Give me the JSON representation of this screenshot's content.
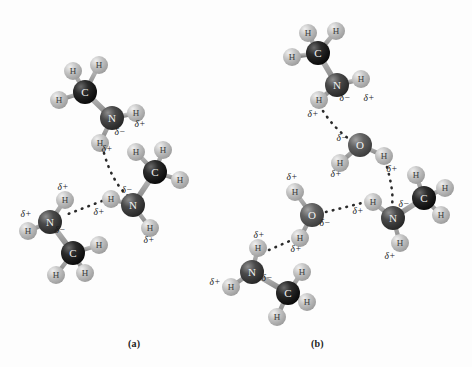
{
  "figure": {
    "background": "#fdfdfd",
    "width": 472,
    "height": 367,
    "panels": [
      {
        "key": "a",
        "label": "(a)",
        "x": 128,
        "y": 338
      },
      {
        "key": "b",
        "label": "(b)",
        "x": 311,
        "y": 338
      }
    ],
    "bottom_cut_text": ""
  },
  "style": {
    "carbon_color": "#141414",
    "carbon_highlight": "#6a6a6a",
    "nitrogen_color": "#3a3a3a",
    "nitrogen_highlight": "#8e8e8e",
    "oxygen_color": "#565656",
    "oxygen_highlight": "#a2a2a2",
    "hydrogen_color": "#b4b4b4",
    "hydrogen_highlight": "#ececec",
    "bond_color": "#9a9a9a",
    "hbond_color": "#2a2a2a",
    "atom_text_color": "#f2f2f2",
    "charge_text_color": "#1d1d1d"
  },
  "legend": {
    "carbon_symbol": "C",
    "nitrogen_symbol": "N",
    "oxygen_symbol": "O",
    "hydrogen_symbol": "H",
    "delta_negative": "δ−",
    "delta_positive": "δ+"
  },
  "panel_a": {
    "molecules": [
      {
        "name": "methylamine-top-left",
        "atoms": [
          {
            "id": "a1C",
            "element": "C",
            "label": "C",
            "x": 85,
            "y": 92,
            "r": 12
          },
          {
            "id": "a1H1",
            "element": "H",
            "label": "H",
            "x": 73,
            "y": 71,
            "r": 9
          },
          {
            "id": "a1H2",
            "element": "H",
            "label": "H",
            "x": 99,
            "y": 65,
            "r": 9
          },
          {
            "id": "a1H3",
            "element": "H",
            "label": "H",
            "x": 59,
            "y": 100,
            "r": 9
          },
          {
            "id": "a1N",
            "element": "N",
            "label": "N",
            "x": 112,
            "y": 118,
            "r": 12
          },
          {
            "id": "a1H4",
            "element": "H",
            "label": "H",
            "x": 136,
            "y": 113,
            "r": 9
          },
          {
            "id": "a1H5",
            "element": "H",
            "label": "H",
            "x": 100,
            "y": 143,
            "r": 9
          }
        ],
        "bonds": [
          [
            "a1C",
            "a1H1"
          ],
          [
            "a1C",
            "a1H2"
          ],
          [
            "a1C",
            "a1H3"
          ],
          [
            "a1C",
            "a1N"
          ],
          [
            "a1N",
            "a1H4"
          ],
          [
            "a1N",
            "a1H5"
          ]
        ]
      },
      {
        "name": "methylamine-right",
        "atoms": [
          {
            "id": "a2C",
            "element": "C",
            "label": "C",
            "x": 155,
            "y": 172,
            "r": 12
          },
          {
            "id": "a2H1",
            "element": "H",
            "label": "H",
            "x": 136,
            "y": 152,
            "r": 9
          },
          {
            "id": "a2H2",
            "element": "H",
            "label": "H",
            "x": 163,
            "y": 150,
            "r": 9
          },
          {
            "id": "a2H3",
            "element": "H",
            "label": "H",
            "x": 180,
            "y": 180,
            "r": 9
          },
          {
            "id": "a2N",
            "element": "N",
            "label": "N",
            "x": 133,
            "y": 205,
            "r": 12
          },
          {
            "id": "a2H4",
            "element": "H",
            "label": "H",
            "x": 111,
            "y": 199,
            "r": 9
          },
          {
            "id": "a2H5",
            "element": "H",
            "label": "H",
            "x": 150,
            "y": 228,
            "r": 9
          }
        ],
        "bonds": [
          [
            "a2C",
            "a2H1"
          ],
          [
            "a2C",
            "a2H2"
          ],
          [
            "a2C",
            "a2H3"
          ],
          [
            "a2C",
            "a2N"
          ],
          [
            "a2N",
            "a2H4"
          ],
          [
            "a2N",
            "a2H5"
          ]
        ]
      },
      {
        "name": "methylamine-bottom-left",
        "atoms": [
          {
            "id": "a3N",
            "element": "N",
            "label": "N",
            "x": 50,
            "y": 222,
            "r": 12
          },
          {
            "id": "a3H1",
            "element": "H",
            "label": "H",
            "x": 65,
            "y": 200,
            "r": 9
          },
          {
            "id": "a3H2",
            "element": "H",
            "label": "H",
            "x": 28,
            "y": 231,
            "r": 9
          },
          {
            "id": "a3C",
            "element": "C",
            "label": "C",
            "x": 73,
            "y": 253,
            "r": 12
          },
          {
            "id": "a3H3",
            "element": "H",
            "label": "H",
            "x": 99,
            "y": 245,
            "r": 9
          },
          {
            "id": "a3H4",
            "element": "H",
            "label": "H",
            "x": 85,
            "y": 273,
            "r": 9
          },
          {
            "id": "a3H5",
            "element": "H",
            "label": "H",
            "x": 56,
            "y": 275,
            "r": 9
          }
        ],
        "bonds": [
          [
            "a3N",
            "a3H1"
          ],
          [
            "a3N",
            "a3H2"
          ],
          [
            "a3N",
            "a3C"
          ],
          [
            "a3C",
            "a3H3"
          ],
          [
            "a3C",
            "a3H4"
          ],
          [
            "a3C",
            "a3H5"
          ]
        ]
      }
    ],
    "hbonds": [
      {
        "name": "hbond-topN-H-to-rightN",
        "from": "a1H5",
        "to": "a2N",
        "path": "M 104 153 Q 112 182 128 196"
      },
      {
        "name": "hbond-rightN-H-to-leftN",
        "from": "a2H4",
        "to": "a3N",
        "path": "M 102 201 L 63 216"
      }
    ],
    "charges": [
      {
        "text": "δ−",
        "x": 120,
        "y": 135,
        "for": "a1N"
      },
      {
        "text": "δ+",
        "x": 140,
        "y": 127,
        "for": "a1H4"
      },
      {
        "text": "δ+",
        "x": 107,
        "y": 152,
        "for": "a1H5"
      },
      {
        "text": "δ−",
        "x": 127,
        "y": 193,
        "for": "a2N"
      },
      {
        "text": "δ+",
        "x": 99,
        "y": 215,
        "for": "a2H4"
      },
      {
        "text": "δ+",
        "x": 149,
        "y": 243,
        "for": "a2H5"
      },
      {
        "text": "δ+",
        "x": 63,
        "y": 190,
        "for": "a3H1"
      },
      {
        "text": "δ+",
        "x": 26,
        "y": 217,
        "for": "a3H2"
      },
      {
        "text": "δ−",
        "x": 60,
        "y": 233,
        "for": "a3N"
      }
    ]
  },
  "panel_b": {
    "molecules": [
      {
        "name": "methylamine-top",
        "atoms": [
          {
            "id": "b1C",
            "element": "C",
            "label": "C",
            "x": 318,
            "y": 53,
            "r": 12
          },
          {
            "id": "b1H1",
            "element": "H",
            "label": "H",
            "x": 308,
            "y": 33,
            "r": 9
          },
          {
            "id": "b1H2",
            "element": "H",
            "label": "H",
            "x": 336,
            "y": 31,
            "r": 9
          },
          {
            "id": "b1H3",
            "element": "H",
            "label": "H",
            "x": 292,
            "y": 57,
            "r": 9
          },
          {
            "id": "b1N",
            "element": "N",
            "label": "N",
            "x": 337,
            "y": 85,
            "r": 12
          },
          {
            "id": "b1H4",
            "element": "H",
            "label": "H",
            "x": 361,
            "y": 79,
            "r": 9
          },
          {
            "id": "b1H5",
            "element": "H",
            "label": "H",
            "x": 319,
            "y": 100,
            "r": 9
          }
        ],
        "bonds": [
          [
            "b1C",
            "b1H1"
          ],
          [
            "b1C",
            "b1H2"
          ],
          [
            "b1C",
            "b1H3"
          ],
          [
            "b1C",
            "b1N"
          ],
          [
            "b1N",
            "b1H4"
          ],
          [
            "b1N",
            "b1H5"
          ]
        ]
      },
      {
        "name": "water-upper",
        "atoms": [
          {
            "id": "b2O",
            "element": "O",
            "label": "O",
            "x": 360,
            "y": 145,
            "r": 12
          },
          {
            "id": "b2H1",
            "element": "H",
            "label": "H",
            "x": 340,
            "y": 163,
            "r": 9
          },
          {
            "id": "b2H2",
            "element": "H",
            "label": "H",
            "x": 384,
            "y": 156,
            "r": 9
          }
        ],
        "bonds": [
          [
            "b2O",
            "b2H1"
          ],
          [
            "b2O",
            "b2H2"
          ]
        ]
      },
      {
        "name": "water-left",
        "atoms": [
          {
            "id": "b3O",
            "element": "O",
            "label": "O",
            "x": 312,
            "y": 215,
            "r": 12
          },
          {
            "id": "b3H1",
            "element": "H",
            "label": "H",
            "x": 295,
            "y": 192,
            "r": 9
          },
          {
            "id": "b3H2",
            "element": "H",
            "label": "H",
            "x": 300,
            "y": 238,
            "r": 9
          }
        ],
        "bonds": [
          [
            "b3O",
            "b3H1"
          ],
          [
            "b3O",
            "b3H2"
          ]
        ]
      },
      {
        "name": "methylamine-right",
        "atoms": [
          {
            "id": "b4N",
            "element": "N",
            "label": "N",
            "x": 393,
            "y": 218,
            "r": 12
          },
          {
            "id": "b4H1",
            "element": "H",
            "label": "H",
            "x": 373,
            "y": 202,
            "r": 9
          },
          {
            "id": "b4H2",
            "element": "H",
            "label": "H",
            "x": 400,
            "y": 243,
            "r": 9
          },
          {
            "id": "b4C",
            "element": "C",
            "label": "C",
            "x": 424,
            "y": 198,
            "r": 12
          },
          {
            "id": "b4H3",
            "element": "H",
            "label": "H",
            "x": 416,
            "y": 175,
            "r": 9
          },
          {
            "id": "b4H4",
            "element": "H",
            "label": "H",
            "x": 445,
            "y": 188,
            "r": 9
          },
          {
            "id": "b4H5",
            "element": "H",
            "label": "H",
            "x": 441,
            "y": 215,
            "r": 9
          }
        ],
        "bonds": [
          [
            "b4N",
            "b4H1"
          ],
          [
            "b4N",
            "b4H2"
          ],
          [
            "b4N",
            "b4C"
          ],
          [
            "b4C",
            "b4H3"
          ],
          [
            "b4C",
            "b4H4"
          ],
          [
            "b4C",
            "b4H5"
          ]
        ]
      },
      {
        "name": "methylamine-bottom-left",
        "atoms": [
          {
            "id": "b5N",
            "element": "N",
            "label": "N",
            "x": 252,
            "y": 272,
            "r": 12
          },
          {
            "id": "b5H1",
            "element": "H",
            "label": "H",
            "x": 258,
            "y": 248,
            "r": 9
          },
          {
            "id": "b5H2",
            "element": "H",
            "label": "H",
            "x": 231,
            "y": 287,
            "r": 9
          },
          {
            "id": "b5C",
            "element": "C",
            "label": "C",
            "x": 288,
            "y": 293,
            "r": 12
          },
          {
            "id": "b5H3",
            "element": "H",
            "label": "H",
            "x": 302,
            "y": 272,
            "r": 9
          },
          {
            "id": "b5H4",
            "element": "H",
            "label": "H",
            "x": 307,
            "y": 302,
            "r": 9
          },
          {
            "id": "b5H5",
            "element": "H",
            "label": "H",
            "x": 277,
            "y": 317,
            "r": 9
          }
        ],
        "bonds": [
          [
            "b5N",
            "b5H1"
          ],
          [
            "b5N",
            "b5H2"
          ],
          [
            "b5N",
            "b5C"
          ],
          [
            "b5C",
            "b5H3"
          ],
          [
            "b5C",
            "b5H4"
          ],
          [
            "b5C",
            "b5H5"
          ]
        ]
      }
    ],
    "hbonds": [
      {
        "name": "hbond-amineH-to-waterO",
        "from": "b1H5",
        "to": "b2O",
        "path": "M 323 111 Q 334 128 349 139"
      },
      {
        "name": "hbond-waterH-to-amineN",
        "from": "b2H2",
        "to": "b4N",
        "path": "M 387 167 Q 394 192 392 205"
      },
      {
        "name": "hbond-waterO-to-amineH",
        "from": "b3O",
        "to": "b4H1",
        "path": "M 326 212 L 362 203"
      },
      {
        "name": "hbond-amineH-to-waterO2",
        "from": "b5H1",
        "to": "b3H2",
        "path": "M 269 250 L 292 240"
      }
    ],
    "charges": [
      {
        "text": "δ−",
        "x": 345,
        "y": 101,
        "for": "b1N"
      },
      {
        "text": "δ+",
        "x": 369,
        "y": 101,
        "for": "b1H4"
      },
      {
        "text": "δ+",
        "x": 313,
        "y": 117,
        "for": "b1H5"
      },
      {
        "text": "δ−",
        "x": 342,
        "y": 141,
        "for": "b2O"
      },
      {
        "text": "δ+",
        "x": 336,
        "y": 177,
        "for": "b2H1"
      },
      {
        "text": "δ+",
        "x": 392,
        "y": 172,
        "for": "b2H2"
      },
      {
        "text": "δ+",
        "x": 292,
        "y": 180,
        "for": "b3H1"
      },
      {
        "text": "δ−",
        "x": 325,
        "y": 226,
        "for": "b3O"
      },
      {
        "text": "δ+",
        "x": 296,
        "y": 252,
        "for": "b3H2"
      },
      {
        "text": "δ+",
        "x": 358,
        "y": 214,
        "for": "b4H1"
      },
      {
        "text": "δ−",
        "x": 404,
        "y": 207,
        "for": "b4N"
      },
      {
        "text": "δ+",
        "x": 390,
        "y": 259,
        "for": "b4H2"
      },
      {
        "text": "δ+",
        "x": 259,
        "y": 238,
        "for": "b5H1"
      },
      {
        "text": "δ−",
        "x": 267,
        "y": 281,
        "for": "b5N"
      },
      {
        "text": "δ+",
        "x": 215,
        "y": 285,
        "for": "b5H2"
      }
    ]
  }
}
